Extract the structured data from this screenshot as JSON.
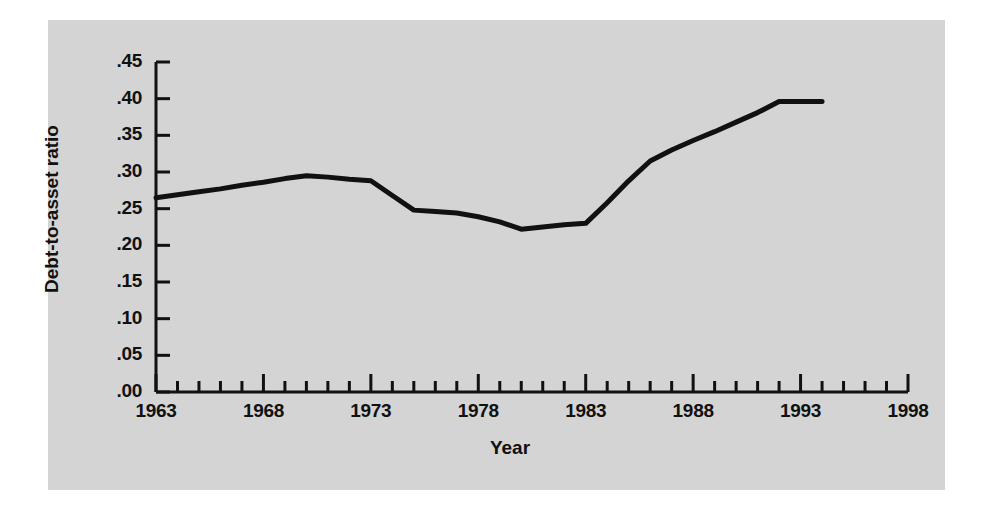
{
  "chart_data": {
    "type": "line",
    "title": "",
    "xlabel": "Year",
    "ylabel": "Debt-to-asset ratio",
    "xlim": [
      1963,
      1998
    ],
    "ylim": [
      0.0,
      0.45
    ],
    "grid": false,
    "legend": null,
    "x_tick_labels": [
      "1963",
      "1968",
      "1973",
      "1978",
      "1983",
      "1988",
      "1993",
      "1998"
    ],
    "x_tick_values": [
      1963,
      1968,
      1973,
      1978,
      1983,
      1988,
      1993,
      1998
    ],
    "x_minor_tick_step": 1,
    "y_tick_labels": [
      ".45",
      ".40",
      ".35",
      ".30",
      ".25",
      ".20",
      ".15",
      ".10",
      ".05",
      ".00"
    ],
    "y_tick_values": [
      0.45,
      0.4,
      0.35,
      0.3,
      0.25,
      0.2,
      0.15,
      0.1,
      0.05,
      0.0
    ],
    "series": [
      {
        "name": "Debt-to-asset ratio",
        "color": "#111111",
        "line_width": 5,
        "x": [
          1963,
          1964,
          1965,
          1966,
          1967,
          1968,
          1969,
          1970,
          1971,
          1972,
          1973,
          1974,
          1975,
          1976,
          1977,
          1978,
          1979,
          1980,
          1981,
          1982,
          1983,
          1984,
          1985,
          1986,
          1987,
          1988,
          1989,
          1990,
          1991,
          1992,
          1993,
          1994
        ],
        "y": [
          0.265,
          0.269,
          0.273,
          0.277,
          0.282,
          0.286,
          0.291,
          0.295,
          0.293,
          0.29,
          0.288,
          0.268,
          0.248,
          0.246,
          0.244,
          0.239,
          0.232,
          0.222,
          0.225,
          0.228,
          0.23,
          0.258,
          0.288,
          0.315,
          0.33,
          0.343,
          0.355,
          0.368,
          0.381,
          0.396,
          0.396,
          0.396
        ]
      }
    ]
  },
  "axis": {
    "y_title": "Debt-to-asset ratio",
    "x_title": "Year"
  },
  "colors": {
    "panel_background": "#d4d4d4",
    "page_background": "#ffffff",
    "axis": "#111111",
    "line": "#111111"
  }
}
